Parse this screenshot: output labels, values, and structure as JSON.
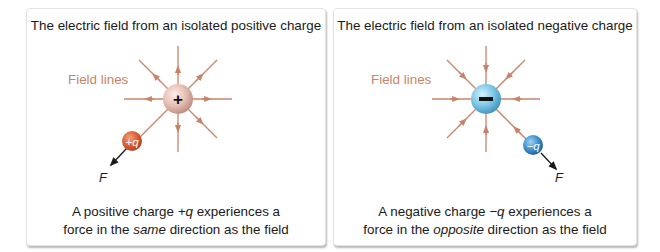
{
  "colors": {
    "field_line": "#c8846a",
    "field_label": "#c8846a",
    "positive_sphere": "#e8c2b8",
    "negative_sphere": "#7cc6e6",
    "test_positive": "#d9643a",
    "test_negative": "#3a8cc8",
    "force_arrow": "#1a1a1a",
    "text": "#1a1a1a"
  },
  "left_panel": {
    "title": "The electric field from an isolated positive charge",
    "field_label": "Field lines",
    "source_charge_symbol": "+",
    "field_direction": "outward",
    "test_charge_label": "+q",
    "force_label": "F",
    "caption_line1_pre": "A positive charge ",
    "caption_line1_var": "+q",
    "caption_line1_post": " experiences a",
    "caption_line2_pre": "force in the ",
    "caption_line2_em": "same",
    "caption_line2_post": " direction as the field"
  },
  "right_panel": {
    "title": "The electric field from an isolated negative charge",
    "field_label": "Field lines",
    "source_charge_symbol": "−",
    "field_direction": "inward",
    "test_charge_label": "−q",
    "force_label": "F",
    "caption_line1_pre": "A negative charge ",
    "caption_line1_var": "−q",
    "caption_line1_post": " experiences a",
    "caption_line2_pre": "force in the ",
    "caption_line2_em": "opposite",
    "caption_line2_post": " direction as the field"
  }
}
